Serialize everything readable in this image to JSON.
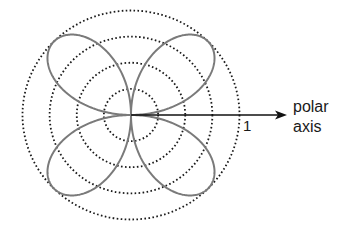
{
  "figure": {
    "type": "polar-rose",
    "equation_implied": "r = sin(2θ)",
    "petals": 4,
    "center": [
      131,
      115
    ],
    "scale_x": 108.5,
    "scale_y": 104.5,
    "grid_radii": [
      0.25,
      0.5,
      0.75,
      1.0
    ],
    "rose_max_r": 1.0,
    "colors": {
      "grid": "#1a1a1a",
      "curve": "#7a7a7a",
      "axis": "#111111",
      "text": "#1a1a1a"
    }
  },
  "labels": {
    "radius_tick": "1",
    "axis_line1": "polar",
    "axis_line2": "axis"
  }
}
